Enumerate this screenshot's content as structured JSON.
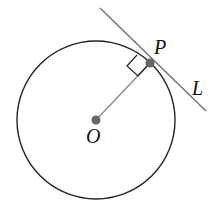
{
  "diagram": {
    "circle": {
      "cx": 96,
      "cy": 120,
      "r": 79,
      "stroke": "#222222"
    },
    "center": {
      "label": "O",
      "x": 96,
      "y": 120,
      "color": "#666666"
    },
    "point": {
      "label": "P",
      "x": 150,
      "y": 63,
      "color": "#666666"
    },
    "radius_segment": {
      "from": "O",
      "to": "P",
      "color": "#888888"
    },
    "tangent_line": {
      "label": "L",
      "x1": 100,
      "y1": 8,
      "x2": 206,
      "y2": 111,
      "color": "#777777"
    },
    "right_angle_marker": {
      "at": "P",
      "meaning": "OP perpendicular to L"
    }
  }
}
